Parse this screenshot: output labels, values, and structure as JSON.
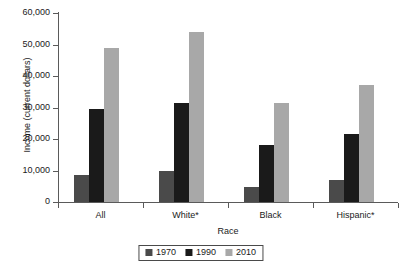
{
  "chart_data": {
    "type": "bar",
    "title": "",
    "xlabel": "Race",
    "ylabel": "Income (current dollars)",
    "categories": [
      "All",
      "White*",
      "Black",
      "Hispanic*"
    ],
    "series": [
      {
        "name": "1970",
        "color": "#4a4a4a",
        "values": [
          8500,
          10000,
          4800,
          7000
        ]
      },
      {
        "name": "1990",
        "color": "#1a1a1a",
        "values": [
          29500,
          31500,
          18000,
          21500
        ]
      },
      {
        "name": "2010",
        "color": "#a8a8a8",
        "values": [
          49000,
          54000,
          31500,
          37000
        ]
      }
    ],
    "ylim": [
      0,
      60000
    ],
    "ytick_values": [
      0,
      10000,
      20000,
      30000,
      40000,
      50000,
      60000
    ],
    "ytick_labels": [
      "0",
      "10,000",
      "20,000",
      "30,000",
      "40,000",
      "50,000",
      "60,000"
    ],
    "grid": false,
    "legend_position": "bottom",
    "legend_entries": [
      "1970",
      "1990",
      "2010"
    ]
  },
  "axis": {
    "y_title": "Income (current dollars)",
    "x_title": "Race"
  }
}
